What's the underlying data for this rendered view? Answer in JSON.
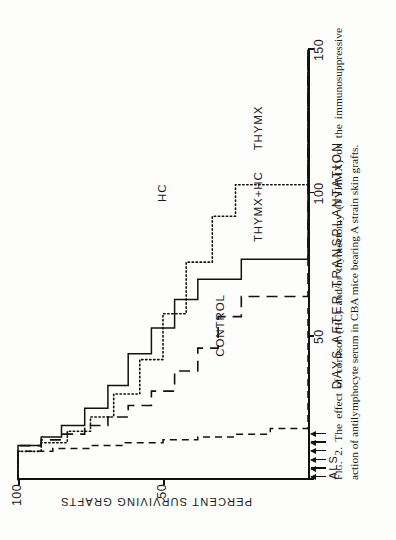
{
  "figure": {
    "number_label": "Fig. 2.",
    "caption_text": "The effect of cortisol (HC) and/or thymectomy (TYHMX) on the immunosuppressive action of antilymphocyte serum in CBA mice bearing A strain skin grafts."
  },
  "treatment_marker": {
    "label": "ALS",
    "arrow_count": 6,
    "arrow_days": [
      1,
      4,
      7,
      10,
      13,
      16
    ]
  },
  "chart_data": {
    "type": "line",
    "title": "",
    "xlabel": "DAYS AFTER TRANSPLANTATION",
    "ylabel": "PERCENT SURVIVING GRAFTS",
    "xlim": [
      0,
      150
    ],
    "ylim": [
      0,
      100
    ],
    "xticks": [
      0,
      50,
      100,
      150
    ],
    "xtick_labels": [
      "",
      "50",
      "100",
      "150"
    ],
    "yticks": [
      50,
      100
    ],
    "ytick_labels": [
      "50",
      "100"
    ],
    "grid": false,
    "legend_position": "inline-annotations",
    "step_style": "post",
    "series": [
      {
        "name": "CONTROL",
        "style": "short-dash",
        "label_x": 43,
        "label_y": 30,
        "x": [
          0,
          9,
          10,
          11,
          12,
          13,
          14,
          15,
          16,
          18,
          60
        ],
        "y": [
          100,
          100,
          88,
          75,
          63,
          50,
          38,
          25,
          13,
          0,
          0
        ]
      },
      {
        "name": "HC",
        "style": "long-dash",
        "label_x": 97,
        "label_y": 50,
        "x": [
          0,
          11,
          12,
          14,
          16,
          19,
          22,
          26,
          31,
          38,
          46,
          57,
          64,
          150
        ],
        "y": [
          100,
          100,
          92,
          85,
          77,
          69,
          62,
          54,
          46,
          38,
          31,
          23,
          0,
          0
        ]
      },
      {
        "name": "THYMX",
        "style": "dotted",
        "label_x": 115,
        "label_y": 17,
        "x": [
          0,
          8,
          10,
          13,
          17,
          22,
          30,
          42,
          58,
          76,
          92,
          103,
          150
        ],
        "y": [
          100,
          100,
          92,
          83,
          75,
          67,
          58,
          50,
          42,
          33,
          25,
          0,
          0
        ]
      },
      {
        "name": "THYMX+HC",
        "style": "solid",
        "label_x": 83,
        "label_y": 17,
        "x": [
          0,
          10,
          12,
          15,
          19,
          25,
          33,
          44,
          53,
          63,
          70,
          77,
          150
        ],
        "y": [
          100,
          100,
          92,
          85,
          77,
          69,
          62,
          54,
          46,
          38,
          23,
          0,
          0
        ]
      }
    ]
  }
}
